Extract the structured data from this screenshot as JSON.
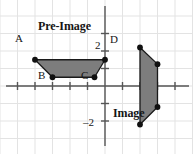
{
  "figure": {
    "type": "coordinate-plane-transformation",
    "background_color": "#ffffff",
    "grid_color": "#e3e3e3",
    "axis_color": "#555555",
    "shape_fill": "#7d7d7d",
    "shape_stroke": "#1a1a1a",
    "vertex_color": "#111111",
    "width": 193,
    "height": 154
  },
  "axes": {
    "origin_px": {
      "x": 105,
      "y": 86
    },
    "unit_px": 17.5,
    "xlim": [
      -6.0,
      5.0
    ],
    "ylim": [
      -3.9,
      4.6
    ],
    "x_tick_values": [
      -5,
      -4,
      -3,
      -2,
      -1,
      1,
      2,
      3,
      4
    ],
    "y_tick_values": [
      -2,
      -1,
      1,
      2,
      3
    ],
    "y_tick_labels": [
      {
        "value": 2,
        "text": "2"
      },
      {
        "value": -2,
        "text": "–2"
      }
    ],
    "x_tick_labels": []
  },
  "shapes": [
    {
      "name": "pre-image",
      "label": "Pre-Image",
      "label_pos": {
        "x": 38,
        "y": 20
      },
      "vertices": [
        {
          "name": "A",
          "x": -4.0,
          "y": 1.5,
          "label": "A",
          "label_pos": {
            "x": 15,
            "y": 33
          }
        },
        {
          "name": "B",
          "x": -3.0,
          "y": 0.5,
          "label": "B",
          "label_pos": {
            "x": 38,
            "y": 70
          }
        },
        {
          "name": "C",
          "x": -0.6,
          "y": 0.5,
          "label": "C",
          "label_pos": {
            "x": 81,
            "y": 70
          }
        },
        {
          "name": "D",
          "x": 0.0,
          "y": 1.5,
          "label": "D",
          "label_pos": {
            "x": 110,
            "y": 34
          }
        }
      ]
    },
    {
      "name": "image",
      "label": "Image",
      "label_pos": {
        "x": 113,
        "y": 107
      },
      "vertices": [
        {
          "name": "A'",
          "x": 2.0,
          "y": 2.2,
          "label": "",
          "label_pos": null
        },
        {
          "name": "B'",
          "x": 3.0,
          "y": 1.25,
          "label": "",
          "label_pos": null
        },
        {
          "name": "C'",
          "x": 3.0,
          "y": -1.2,
          "label": "",
          "label_pos": null
        },
        {
          "name": "D'",
          "x": 2.0,
          "y": -2.2,
          "label": "",
          "label_pos": null
        }
      ]
    }
  ],
  "labels": {
    "pre_image": "Pre-Image",
    "image": "Image",
    "vertex_a": "A",
    "vertex_b": "B",
    "vertex_c": "C",
    "vertex_d": "D",
    "tick_two": "2",
    "tick_minus_two": "–2"
  }
}
